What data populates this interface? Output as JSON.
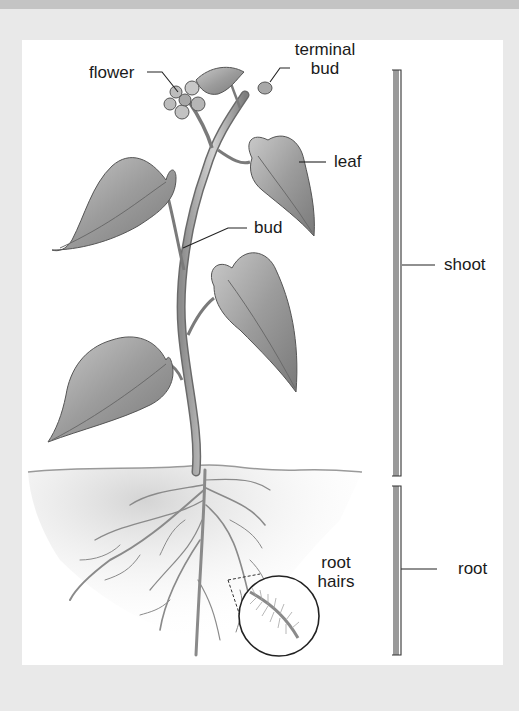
{
  "diagram": {
    "labels": {
      "flower": "flower",
      "terminal_bud_line1": "terminal",
      "terminal_bud_line2": "bud",
      "leaf": "leaf",
      "bud": "bud",
      "shoot": "shoot",
      "root_hairs_line1": "root",
      "root_hairs_line2": "hairs",
      "root": "root"
    },
    "regions": [
      {
        "name": "shoot",
        "bracket_top_y": 70,
        "bracket_bottom_y": 476
      },
      {
        "name": "root",
        "bracket_top_y": 486,
        "bracket_bottom_y": 655
      }
    ],
    "colors": {
      "background": "#e9e9e9",
      "panel": "#ffffff",
      "bracket": "#9a9a9a",
      "ink": "#1a1a1a",
      "leaf": "#a8a8a8",
      "soil": "#d6d6d6"
    }
  }
}
